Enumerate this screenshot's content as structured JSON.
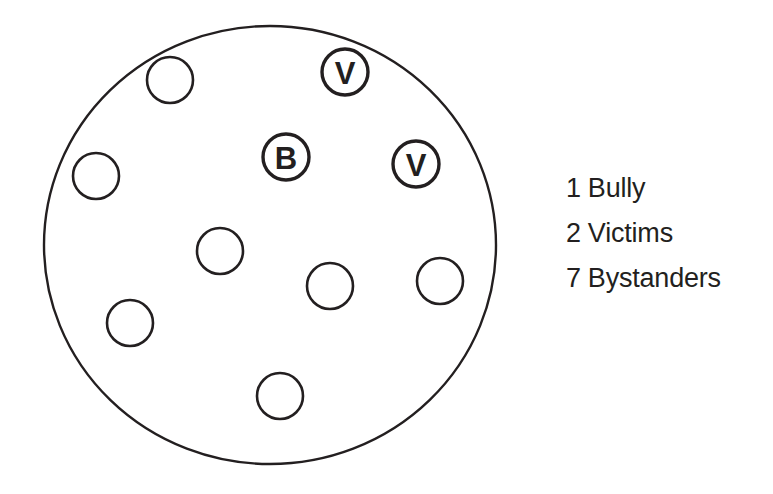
{
  "figure": {
    "kind": "group-composition-diagram",
    "boundary": {
      "shape": "ellipse",
      "cx": 270,
      "cy": 245,
      "rx": 226,
      "ry": 219
    },
    "members": [
      {
        "id": "bystander-1",
        "role": "Bystander",
        "label": "",
        "cx": 170,
        "cy": 80,
        "r": 23
      },
      {
        "id": "victim-1",
        "role": "Victim",
        "label": "V",
        "cx": 345,
        "cy": 72,
        "r": 23
      },
      {
        "id": "bystander-2",
        "role": "Bystander",
        "label": "",
        "cx": 96,
        "cy": 176,
        "r": 23
      },
      {
        "id": "bully-1",
        "role": "Bully",
        "label": "B",
        "cx": 286,
        "cy": 157,
        "r": 23
      },
      {
        "id": "victim-2",
        "role": "Victim",
        "label": "V",
        "cx": 416,
        "cy": 164,
        "r": 23
      },
      {
        "id": "bystander-3",
        "role": "Bystander",
        "label": "",
        "cx": 220,
        "cy": 251,
        "r": 23
      },
      {
        "id": "bystander-4",
        "role": "Bystander",
        "label": "",
        "cx": 330,
        "cy": 286,
        "r": 23
      },
      {
        "id": "bystander-5",
        "role": "Bystander",
        "label": "",
        "cx": 440,
        "cy": 281,
        "r": 23
      },
      {
        "id": "bystander-6",
        "role": "Bystander",
        "label": "",
        "cx": 130,
        "cy": 323,
        "r": 23
      },
      {
        "id": "bystander-7",
        "role": "Bystander",
        "label": "",
        "cx": 280,
        "cy": 396,
        "r": 23
      }
    ]
  },
  "legend": {
    "rows": [
      {
        "count": "1",
        "label": "Bully"
      },
      {
        "count": "2",
        "label": "Victims"
      },
      {
        "count": "7",
        "label": "Bystanders"
      }
    ]
  },
  "colors": {
    "ink": "#231f20",
    "paper": "#ffffff"
  }
}
